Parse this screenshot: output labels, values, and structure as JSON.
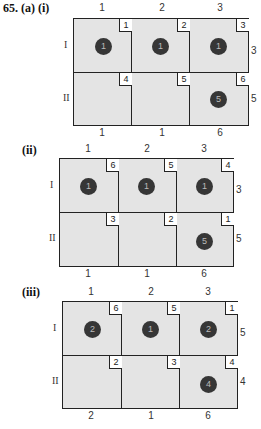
{
  "problem_label": "65. (a) (i)",
  "tables": [
    {
      "label": "",
      "col_headers": [
        "1",
        "2",
        "3"
      ],
      "row_labels": [
        "I",
        "II"
      ],
      "supplies": [
        "3",
        "5"
      ],
      "demands": [
        "1",
        "1",
        "6"
      ],
      "costs": [
        [
          "1",
          "2",
          "3"
        ],
        [
          "4",
          "5",
          "6"
        ]
      ],
      "allocations": [
        [
          "1",
          "1",
          "1"
        ],
        [
          "",
          "",
          "5"
        ]
      ]
    },
    {
      "label": "(ii)",
      "col_headers": [
        "1",
        "2",
        "3"
      ],
      "row_labels": [
        "I",
        "II"
      ],
      "supplies": [
        "3",
        "5"
      ],
      "demands": [
        "1",
        "1",
        "6"
      ],
      "costs": [
        [
          "6",
          "5",
          "4"
        ],
        [
          "3",
          "2",
          "1"
        ]
      ],
      "allocations": [
        [
          "1",
          "1",
          "1"
        ],
        [
          "",
          "",
          "5"
        ]
      ]
    },
    {
      "label": "(iii)",
      "col_headers": [
        "1",
        "2",
        "3"
      ],
      "row_labels": [
        "I",
        "II"
      ],
      "supplies": [
        "5",
        "4"
      ],
      "demands": [
        "2",
        "1",
        "6"
      ],
      "costs": [
        [
          "6",
          "5",
          "1"
        ],
        [
          "2",
          "3",
          "4"
        ]
      ],
      "allocations": [
        [
          "2",
          "1",
          "2"
        ],
        [
          "",
          "",
          "4"
        ]
      ]
    }
  ]
}
